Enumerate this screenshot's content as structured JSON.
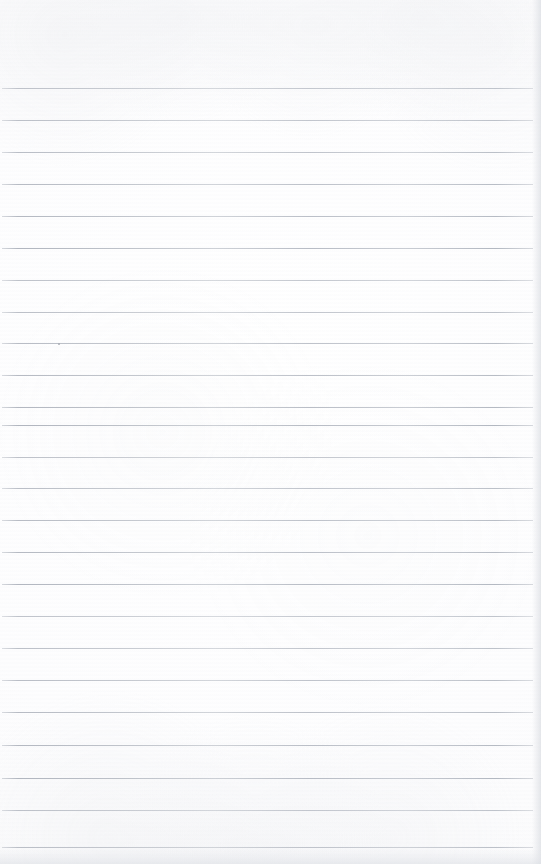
{
  "document": {
    "kind": "scanned-blank-ruled-notebook-page",
    "page_text": "",
    "visible_text": "",
    "note": "No printed or handwritten text is present on this page.",
    "orientation": "portrait"
  },
  "page": {
    "width_px": 541,
    "height_px": 864,
    "paper_color": "#fdfdfe",
    "background_color": "#ffffff",
    "top_margin_px": 88,
    "bottom_margin_px": 17
  },
  "ruling": {
    "line_color": "#b0b5c0",
    "line_thickness_px": 1,
    "line_spacing_px": 31.6,
    "line_count": 25,
    "first_line_y_px": 88,
    "last_line_y_px": 847,
    "line_start_x_px": 2,
    "line_end_x_px": 533,
    "line_length_px": 531,
    "line_y_positions": [
      88,
      120,
      152,
      184,
      216,
      248,
      280,
      312,
      343,
      375,
      407,
      425,
      457,
      488,
      520,
      552,
      584,
      616,
      648,
      680,
      712,
      745,
      778,
      810,
      847
    ]
  },
  "artifacts": {
    "ink_speck": {
      "label": "ink-speck",
      "x_px": 58,
      "y_px": 343,
      "size_px": 2,
      "color": "#a8acb4"
    },
    "right_edge_shadow": {
      "label": "right-edge-shadow",
      "x_px": 532,
      "width_px": 9,
      "color": "#dadde2"
    },
    "bottom_edge_shadow": {
      "label": "bottom-edge-shadow",
      "y_px": 849,
      "height_px": 15,
      "color": "#dde0e5"
    }
  }
}
